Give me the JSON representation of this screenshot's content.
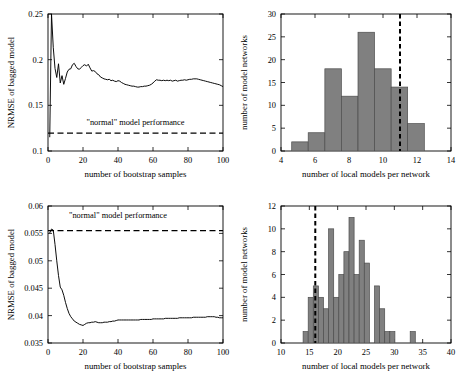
{
  "figure": {
    "background": "#ffffff",
    "line_color": "#000000",
    "bar_fill": "#808080",
    "bar_edge": "#4d4d4d"
  },
  "chart_data": [
    {
      "id": "panel-top-left",
      "type": "line",
      "title": "",
      "xlabel": "number of bootstrap samples",
      "ylabel": "NRMSE of bagged model",
      "xlim": [
        0,
        100
      ],
      "ylim": [
        0.1,
        0.25
      ],
      "xticks": [
        0,
        20,
        40,
        60,
        80,
        100
      ],
      "xticklabels": [
        "0",
        "20",
        "40",
        "60",
        "80",
        "100"
      ],
      "yticks": [
        0.1,
        0.15,
        0.2,
        0.25
      ],
      "yticklabels": [
        "0.1",
        "0.15",
        "0.2",
        "0.25"
      ],
      "grid": false,
      "legend": "none",
      "annotations": [
        {
          "text": "\"normal\" model performance",
          "x": 50,
          "y": 0.1285
        }
      ],
      "reference_lines": [
        {
          "orientation": "horizontal",
          "value": 0.1195,
          "style": "dashed",
          "label": "\"normal\" model performance"
        }
      ],
      "series": [
        {
          "name": "NRMSE of bagged model",
          "x": [
            1,
            2,
            3,
            4,
            5,
            6,
            7,
            8,
            9,
            10,
            11,
            12,
            13,
            14,
            15,
            16,
            17,
            18,
            19,
            20,
            21,
            22,
            23,
            24,
            25,
            26,
            27,
            28,
            29,
            30,
            31,
            32,
            33,
            34,
            35,
            36,
            37,
            38,
            39,
            40,
            41,
            42,
            43,
            44,
            45,
            46,
            47,
            48,
            49,
            50,
            51,
            52,
            53,
            54,
            55,
            56,
            57,
            58,
            59,
            60,
            61,
            62,
            63,
            64,
            65,
            66,
            67,
            68,
            69,
            70,
            71,
            72,
            73,
            74,
            75,
            76,
            77,
            78,
            79,
            80,
            81,
            82,
            83,
            84,
            85,
            86,
            87,
            88,
            89,
            90,
            91,
            92,
            93,
            94,
            95,
            96,
            97,
            98,
            99,
            100
          ],
          "y": [
            0.1155,
            0.25,
            0.2135,
            0.1905,
            0.1805,
            0.1955,
            0.1745,
            0.1825,
            0.173,
            0.1795,
            0.1865,
            0.1895,
            0.19,
            0.1945,
            0.196,
            0.1925,
            0.19,
            0.1895,
            0.1915,
            0.1935,
            0.1945,
            0.193,
            0.195,
            0.191,
            0.1875,
            0.188,
            0.187,
            0.1845,
            0.1835,
            0.181,
            0.18,
            0.179,
            0.1785,
            0.178,
            0.1785,
            0.177,
            0.1775,
            0.1765,
            0.176,
            0.177,
            0.1765,
            0.175,
            0.174,
            0.173,
            0.1725,
            0.172,
            0.1715,
            0.171,
            0.171,
            0.1705,
            0.17,
            0.17,
            0.1705,
            0.1705,
            0.171,
            0.171,
            0.1715,
            0.172,
            0.173,
            0.1745,
            0.1765,
            0.178,
            0.1775,
            0.1775,
            0.177,
            0.1775,
            0.177,
            0.1775,
            0.177,
            0.1775,
            0.1765,
            0.177,
            0.1775,
            0.1765,
            0.177,
            0.1775,
            0.1775,
            0.178,
            0.1775,
            0.178,
            0.1785,
            0.1785,
            0.179,
            0.179,
            0.179,
            0.1785,
            0.178,
            0.1775,
            0.177,
            0.1765,
            0.176,
            0.1755,
            0.175,
            0.1745,
            0.174,
            0.1735,
            0.173,
            0.1725,
            0.1715,
            0.1705
          ]
        }
      ]
    },
    {
      "id": "panel-top-right",
      "type": "bar",
      "title": "",
      "xlabel": "number of local models per network",
      "ylabel": "number of model networks",
      "xlim": [
        4,
        14
      ],
      "ylim": [
        0,
        30
      ],
      "xticks": [
        4,
        6,
        8,
        10,
        12,
        14
      ],
      "xticklabels": [
        "4",
        "6",
        "8",
        "10",
        "12",
        "14"
      ],
      "yticks": [
        0,
        5,
        10,
        15,
        20,
        25,
        30
      ],
      "yticklabels": [
        "0",
        "5",
        "10",
        "15",
        "20",
        "25",
        "30"
      ],
      "grid": false,
      "legend": "none",
      "bin_edges": [
        4.63,
        5.6,
        6.58,
        7.55,
        8.53,
        9.5,
        10.48,
        11.45,
        12.43
      ],
      "values": [
        2,
        4,
        18,
        12,
        26,
        18,
        14,
        6
      ],
      "reference_lines": [
        {
          "orientation": "vertical",
          "value": 11.0,
          "style": "dashed"
        }
      ]
    },
    {
      "id": "panel-bottom-left",
      "type": "line",
      "title": "",
      "xlabel": "number of bootstrap samples",
      "ylabel": "NRMSE of bagged model",
      "xlim": [
        0,
        100
      ],
      "ylim": [
        0.035,
        0.06
      ],
      "xticks": [
        0,
        20,
        40,
        60,
        80,
        100
      ],
      "xticklabels": [
        "0",
        "20",
        "40",
        "60",
        "80",
        "100"
      ],
      "yticks": [
        0.035,
        0.04,
        0.045,
        0.05,
        0.055,
        0.06
      ],
      "yticklabels": [
        "0.035",
        "0.04",
        "0.045",
        "0.05",
        "0.055",
        "0.06"
      ],
      "grid": false,
      "legend": "none",
      "annotations": [
        {
          "text": "\"normal\" model performance",
          "x": 40,
          "y": 0.0578
        }
      ],
      "reference_lines": [
        {
          "orientation": "horizontal",
          "value": 0.0555,
          "style": "dashed",
          "label": "\"normal\" model performance"
        }
      ],
      "series": [
        {
          "name": "NRMSE of bagged model",
          "x": [
            1,
            2,
            3,
            4,
            5,
            6,
            7,
            8,
            9,
            10,
            11,
            12,
            13,
            14,
            15,
            16,
            17,
            18,
            19,
            20,
            21,
            22,
            23,
            24,
            25,
            26,
            27,
            28,
            29,
            30,
            31,
            32,
            33,
            34,
            35,
            36,
            37,
            38,
            39,
            40,
            41,
            42,
            43,
            44,
            45,
            46,
            47,
            48,
            49,
            50,
            51,
            52,
            53,
            54,
            55,
            56,
            57,
            58,
            59,
            60,
            61,
            62,
            63,
            64,
            65,
            66,
            67,
            68,
            69,
            70,
            71,
            72,
            73,
            74,
            75,
            76,
            77,
            78,
            79,
            80,
            81,
            82,
            83,
            84,
            85,
            86,
            87,
            88,
            89,
            90,
            91,
            92,
            93,
            94,
            95,
            96,
            97,
            98,
            99,
            100
          ],
          "y": [
            0.0551,
            0.0558,
            0.0556,
            0.053,
            0.05,
            0.0473,
            0.0452,
            0.0447,
            0.0437,
            0.0424,
            0.0413,
            0.0404,
            0.0398,
            0.0394,
            0.039,
            0.0388,
            0.0386,
            0.0384,
            0.0383,
            0.0382,
            0.0384,
            0.0386,
            0.0387,
            0.0387,
            0.0388,
            0.0388,
            0.0389,
            0.0388,
            0.0387,
            0.0387,
            0.0387,
            0.0388,
            0.0388,
            0.0388,
            0.0389,
            0.0389,
            0.039,
            0.039,
            0.0391,
            0.0392,
            0.0392,
            0.0392,
            0.0392,
            0.0392,
            0.0392,
            0.0392,
            0.0392,
            0.0392,
            0.0392,
            0.0392,
            0.0392,
            0.0392,
            0.0393,
            0.0393,
            0.0393,
            0.0393,
            0.0393,
            0.0393,
            0.0393,
            0.0394,
            0.0394,
            0.0394,
            0.0394,
            0.0394,
            0.0394,
            0.0394,
            0.0395,
            0.0395,
            0.0395,
            0.0395,
            0.0395,
            0.0395,
            0.0395,
            0.0395,
            0.0396,
            0.0396,
            0.0396,
            0.0396,
            0.0396,
            0.0396,
            0.0396,
            0.0396,
            0.0397,
            0.0397,
            0.0397,
            0.0397,
            0.0397,
            0.0397,
            0.0397,
            0.0397,
            0.0398,
            0.0398,
            0.0398,
            0.0398,
            0.0398,
            0.0397,
            0.0397,
            0.0396,
            0.0396,
            0.0396
          ]
        }
      ]
    },
    {
      "id": "panel-bottom-right",
      "type": "bar",
      "title": "",
      "xlabel": "number of local models per network",
      "ylabel": "number of model networks",
      "xlim": [
        10,
        40
      ],
      "ylim": [
        0,
        12
      ],
      "xticks": [
        10,
        15,
        20,
        25,
        30,
        35,
        40
      ],
      "xticklabels": [
        "10",
        "15",
        "20",
        "25",
        "30",
        "35",
        "40"
      ],
      "yticks": [
        0,
        2,
        4,
        6,
        8,
        10,
        12
      ],
      "yticklabels": [
        "0",
        "2",
        "4",
        "6",
        "8",
        "10",
        "12"
      ],
      "grid": false,
      "legend": "none",
      "bin_edges": [
        13.9,
        14.8,
        15.7,
        16.6,
        17.5,
        18.4,
        19.3,
        20.2,
        21.1,
        22.0,
        22.9,
        23.8,
        24.7,
        25.6,
        26.5,
        27.4,
        28.3,
        29.2,
        30.1,
        31.0,
        31.9,
        32.8,
        33.7,
        34.6,
        35.5,
        36.4
      ],
      "values": [
        1,
        4,
        5,
        4,
        3,
        10,
        4,
        6,
        8,
        11,
        6,
        9,
        7,
        0,
        5,
        3,
        1,
        1,
        0,
        0,
        0,
        1
      ],
      "reference_lines": [
        {
          "orientation": "vertical",
          "value": 16.05,
          "style": "dashed"
        }
      ]
    }
  ]
}
